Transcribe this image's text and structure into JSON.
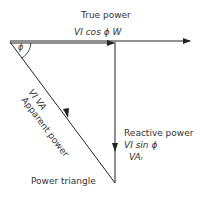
{
  "diagram": {
    "caption": "Power triangle",
    "true_power": {
      "title": "True power",
      "formula": "VI cos ϕ W"
    },
    "reactive_power": {
      "title": "Reactive power",
      "formula": "VI sin ϕ",
      "unit": "VAᵣ"
    },
    "apparent_power": {
      "formula": "VI   VA",
      "title": "Apparent power"
    },
    "angle": "ϕ",
    "colors": {
      "line": "#222222",
      "background": "#ffffff"
    }
  }
}
